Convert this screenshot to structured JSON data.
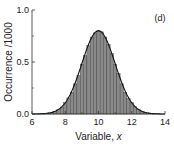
{
  "chart_data": {
    "type": "bar",
    "subtype": "histogram-with-fit",
    "panel_label": "(d)",
    "xlabel": "Variable, ",
    "xlabel_italic": "x",
    "ylabel": "Occurrence /1000",
    "xlim": [
      6,
      14
    ],
    "ylim": [
      0.0,
      1.0
    ],
    "x_ticks": [
      6,
      8,
      10,
      12,
      14
    ],
    "x_tick_labels": [
      "6",
      "8",
      "10",
      "12",
      "14"
    ],
    "y_ticks": [
      0.0,
      0.5,
      1.0
    ],
    "y_tick_labels": [
      "0.0",
      "0.5",
      "1.0"
    ],
    "grid": false,
    "legend": null,
    "fit": {
      "type": "gaussian",
      "mean": 10,
      "sigma": 1.0,
      "peak": 0.8
    },
    "bin_width": 0.2,
    "bins_x": [
      6.6,
      6.8,
      7.0,
      7.2,
      7.4,
      7.6,
      7.8,
      8.0,
      8.2,
      8.4,
      8.6,
      8.8,
      9.0,
      9.2,
      9.4,
      9.6,
      9.8,
      10.0,
      10.2,
      10.4,
      10.6,
      10.8,
      11.0,
      11.2,
      11.4,
      11.6,
      11.8,
      12.0,
      12.2,
      12.4,
      12.6,
      12.8,
      13.0,
      13.2,
      13.4
    ],
    "values": [
      0.002,
      0.005,
      0.009,
      0.016,
      0.027,
      0.043,
      0.067,
      0.108,
      0.155,
      0.21,
      0.29,
      0.37,
      0.48,
      0.56,
      0.66,
      0.74,
      0.78,
      0.8,
      0.79,
      0.74,
      0.67,
      0.58,
      0.48,
      0.39,
      0.29,
      0.21,
      0.15,
      0.11,
      0.07,
      0.045,
      0.028,
      0.016,
      0.009,
      0.005,
      0.002
    ],
    "colors": {
      "bar_fill": "#8a8a8a",
      "bar_edge": "#3a3a3a",
      "fit_line": "#111111",
      "axis": "#333333"
    }
  }
}
